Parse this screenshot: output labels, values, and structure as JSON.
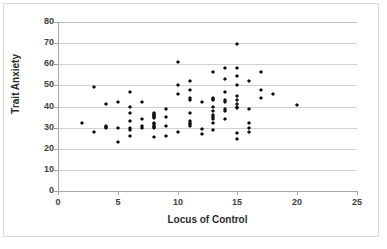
{
  "chart_data": {
    "type": "scatter",
    "title": "",
    "xlabel": "Locus of Control",
    "ylabel": "Trait Anxiety",
    "xlim": [
      0,
      25
    ],
    "ylim": [
      0,
      80
    ],
    "xticks": [
      0,
      5,
      10,
      15,
      20,
      25
    ],
    "yticks": [
      0,
      10,
      20,
      30,
      40,
      50,
      60,
      70,
      80
    ],
    "grid": "horizontal",
    "legend": "none",
    "marker_color": "#111111",
    "points": [
      [
        2,
        32
      ],
      [
        3,
        49
      ],
      [
        3,
        28
      ],
      [
        4,
        41
      ],
      [
        4,
        31
      ],
      [
        4,
        30.5
      ],
      [
        4,
        30
      ],
      [
        5,
        42
      ],
      [
        5,
        30
      ],
      [
        5,
        23
      ],
      [
        6,
        47
      ],
      [
        6,
        40
      ],
      [
        6,
        37
      ],
      [
        6,
        33
      ],
      [
        6,
        30
      ],
      [
        6,
        29
      ],
      [
        6,
        26
      ],
      [
        7,
        42
      ],
      [
        7,
        34
      ],
      [
        7,
        31
      ],
      [
        7,
        30
      ],
      [
        8,
        37
      ],
      [
        8,
        36.5
      ],
      [
        8,
        36
      ],
      [
        8,
        35.5
      ],
      [
        8,
        35
      ],
      [
        8,
        34.5
      ],
      [
        8,
        32
      ],
      [
        8,
        31.5
      ],
      [
        8,
        31
      ],
      [
        8,
        30.5
      ],
      [
        8,
        30
      ],
      [
        8,
        25.5
      ],
      [
        9,
        39
      ],
      [
        9,
        35
      ],
      [
        9,
        31
      ],
      [
        9,
        26
      ],
      [
        10,
        61
      ],
      [
        10,
        50
      ],
      [
        10,
        46
      ],
      [
        10,
        28
      ],
      [
        11,
        52
      ],
      [
        11,
        48
      ],
      [
        11,
        44
      ],
      [
        11,
        43
      ],
      [
        11,
        37
      ],
      [
        11,
        33
      ],
      [
        11,
        32
      ],
      [
        11,
        31.5
      ],
      [
        11,
        31
      ],
      [
        12,
        42
      ],
      [
        12,
        29.5
      ],
      [
        12,
        27
      ],
      [
        13,
        56.5
      ],
      [
        13,
        44
      ],
      [
        13,
        43.5
      ],
      [
        13,
        43
      ],
      [
        13,
        40
      ],
      [
        13,
        38
      ],
      [
        13,
        36
      ],
      [
        13,
        35
      ],
      [
        13,
        34
      ],
      [
        13,
        32
      ],
      [
        13,
        29
      ],
      [
        14,
        58
      ],
      [
        14,
        53
      ],
      [
        14,
        47
      ],
      [
        14,
        43
      ],
      [
        14,
        42
      ],
      [
        14,
        39
      ],
      [
        14,
        38
      ],
      [
        14,
        34
      ],
      [
        15,
        69.5
      ],
      [
        15,
        58
      ],
      [
        15,
        54.5
      ],
      [
        15,
        50
      ],
      [
        15,
        45
      ],
      [
        15,
        43
      ],
      [
        15,
        41
      ],
      [
        15,
        40
      ],
      [
        15,
        39.5
      ],
      [
        15,
        27.5
      ],
      [
        15,
        24.5
      ],
      [
        16,
        52
      ],
      [
        16,
        39
      ],
      [
        16,
        32
      ],
      [
        16,
        30
      ],
      [
        16,
        28
      ],
      [
        17,
        56.5
      ],
      [
        17,
        48
      ],
      [
        17,
        44
      ],
      [
        18,
        46
      ],
      [
        20,
        40.5
      ]
    ]
  }
}
